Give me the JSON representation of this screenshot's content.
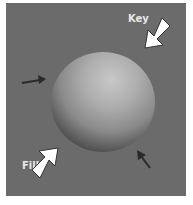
{
  "diagram": {
    "labels": {
      "key": "Key",
      "fill": "Fill"
    },
    "colors": {
      "background": "#6b6b6b",
      "arrow_light": "#ffffff",
      "arrow_rim": "#2a2a2a",
      "label": "#e8e8e8"
    }
  }
}
